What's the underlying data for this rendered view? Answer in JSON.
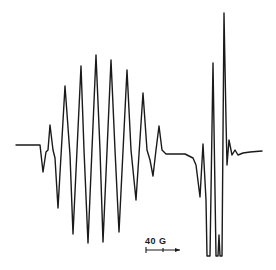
{
  "chart_data": {
    "type": "line",
    "title": "",
    "xlabel": "",
    "ylabel": "",
    "grid": false,
    "legend": [],
    "scale_bar": {
      "label": "40 G",
      "length_px": 34
    },
    "color": "#1a1a1a",
    "points": [
      [
        16,
        145
      ],
      [
        40,
        145
      ],
      [
        43,
        172
      ],
      [
        46,
        152
      ],
      [
        48,
        150
      ],
      [
        50,
        125
      ],
      [
        53,
        150
      ],
      [
        55,
        158
      ],
      [
        58,
        208
      ],
      [
        65,
        86
      ],
      [
        70,
        155
      ],
      [
        73,
        234
      ],
      [
        81,
        66
      ],
      [
        84,
        150
      ],
      [
        88,
        243
      ],
      [
        96,
        55
      ],
      [
        100,
        150
      ],
      [
        103,
        242
      ],
      [
        111,
        60
      ],
      [
        115,
        150
      ],
      [
        119,
        232
      ],
      [
        127,
        70
      ],
      [
        131,
        150
      ],
      [
        136,
        200
      ],
      [
        143,
        93
      ],
      [
        147,
        150
      ],
      [
        150,
        160
      ],
      [
        153,
        176
      ],
      [
        156,
        150
      ],
      [
        159,
        126
      ],
      [
        162,
        150
      ],
      [
        166,
        154
      ],
      [
        185,
        154
      ],
      [
        193,
        158
      ],
      [
        196,
        165
      ],
      [
        200,
        197
      ],
      [
        203,
        144
      ],
      [
        206,
        200
      ],
      [
        207,
        256
      ],
      [
        210,
        256
      ],
      [
        213,
        63
      ],
      [
        216,
        256
      ],
      [
        218,
        256
      ],
      [
        219,
        235
      ],
      [
        220,
        256
      ],
      [
        222,
        256
      ],
      [
        224,
        13
      ],
      [
        226,
        120
      ],
      [
        227,
        165
      ],
      [
        229,
        140
      ],
      [
        232,
        155
      ],
      [
        235,
        150
      ],
      [
        238,
        155
      ],
      [
        243,
        153
      ],
      [
        250,
        152
      ],
      [
        262,
        151
      ]
    ],
    "left_multiplet": {
      "peaks": [
        [
          50,
          125
        ],
        [
          65,
          86
        ],
        [
          81,
          66
        ],
        [
          96,
          55
        ],
        [
          111,
          60
        ],
        [
          127,
          70
        ],
        [
          143,
          93
        ],
        [
          159,
          126
        ]
      ],
      "troughs": [
        [
          43,
          172
        ],
        [
          58,
          208
        ],
        [
          73,
          234
        ],
        [
          88,
          243
        ],
        [
          103,
          242
        ],
        [
          119,
          232
        ],
        [
          136,
          200
        ],
        [
          153,
          176
        ]
      ]
    },
    "right_signal": {
      "peaks": [
        [
          203,
          144
        ],
        [
          213,
          63
        ],
        [
          224,
          13
        ]
      ],
      "troughs": [
        [
          200,
          197
        ],
        [
          207,
          256
        ],
        [
          216,
          256
        ],
        [
          222,
          256
        ]
      ]
    }
  }
}
